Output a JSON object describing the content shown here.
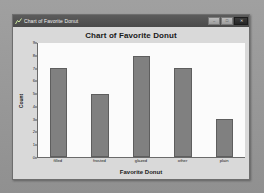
{
  "window": {
    "title": "Chart of Favorite Donut",
    "icon": "chart-icon",
    "minimize_label": "–",
    "maximize_label": "□",
    "close_label": "✕"
  },
  "colors": {
    "bar_fill": "#808080",
    "bar_edge": "#5e5e5e",
    "plot_background": "#fbfbfb",
    "window_background": "#d9d9d9",
    "titlebar": "#4a4a4a",
    "desktop": "#9b9b9b",
    "text": "#1a1a1a"
  },
  "chart_data": {
    "type": "bar",
    "title": "Chart of Favorite Donut",
    "xlabel": "Favorite Donut",
    "ylabel": "Count",
    "categories": [
      "filled",
      "frosted",
      "glazed",
      "other",
      "plain"
    ],
    "values": [
      7,
      5,
      8,
      7,
      3
    ],
    "ylim": [
      0,
      9
    ],
    "yticks": [
      0,
      1,
      2,
      3,
      4,
      5,
      6,
      7,
      8,
      9
    ],
    "ytick_labels": [
      "0",
      "1",
      "2",
      "3",
      "4",
      "5",
      "6",
      "7",
      "8",
      "9"
    ],
    "grid": false,
    "legend": false
  }
}
